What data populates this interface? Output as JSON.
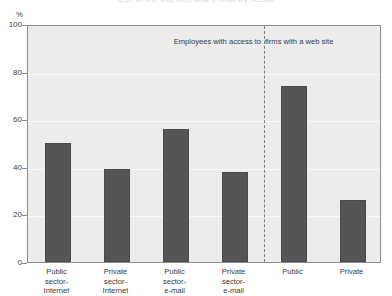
{
  "figure": {
    "title_sliver": "Use of the Internet and e-mail by sector",
    "unit_label": "%"
  },
  "chart_data": {
    "type": "bar",
    "title": "",
    "xlabel": "",
    "ylabel": "%",
    "ylim": [
      0,
      100
    ],
    "yticks": [
      0,
      20,
      40,
      60,
      80,
      100
    ],
    "grid": true,
    "legend": "none",
    "categories": [
      "Public sector-Internet",
      "Private sector-Internet",
      "Public sector-e-mail",
      "Private sector-e-mail",
      "Public",
      "Private"
    ],
    "category_lines": [
      [
        "Public",
        "sector-",
        "Internet"
      ],
      [
        "Private",
        "sector-",
        "Internet"
      ],
      [
        "Public",
        "sector-",
        "e-mail"
      ],
      [
        "Private",
        "sector-",
        "e-mail"
      ],
      [
        "Public"
      ],
      [
        "Private"
      ]
    ],
    "values": [
      50,
      39,
      56,
      38,
      74,
      26
    ],
    "bar_color": "#555555",
    "plot_background": "#ececec",
    "annotations": [
      {
        "text": "Employees with access to",
        "group": "left"
      },
      {
        "text": "firms with a web site",
        "group": "right"
      }
    ],
    "divider": {
      "type": "dashed-vertical",
      "after_category_index": 3
    }
  }
}
